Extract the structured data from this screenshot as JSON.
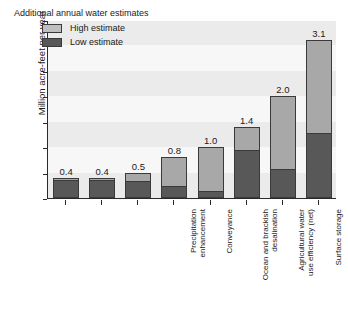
{
  "chart_data": {
    "type": "bar",
    "title": "",
    "xlabel": "",
    "ylabel": "Million acre-feet per year",
    "ylim": [
      0.0,
      3.5
    ],
    "yticks": [
      "0.0",
      "0.5",
      "1.0",
      "1.5",
      "2.0",
      "2.5",
      "3.0",
      "3.5"
    ],
    "grid": false,
    "legend_position": "top-left",
    "legend_title": "Additional annual water estimates",
    "categories": [
      "Precipitation\nenhancement",
      "Conveyance",
      "Ocean and brackish\ndesalination",
      "Agricultural water\nuse efficiency (net)",
      "Surface storage",
      "Recycled municipal\nwater",
      "Conjunctive management\nand groundwater storage",
      "Urban water use\nefficiency (applied)"
    ],
    "series": [
      {
        "name": "Low estimate",
        "color": "#585858",
        "values": [
          0.34,
          0.33,
          0.31,
          0.21,
          0.12,
          0.93,
          0.55,
          1.25
        ]
      },
      {
        "name": "High estimate",
        "color": "#a8a8a8",
        "values": [
          0.4,
          0.4,
          0.5,
          0.8,
          1.0,
          1.4,
          2.0,
          3.1
        ]
      }
    ],
    "value_labels": [
      "0.4",
      "0.4",
      "0.5",
      "0.8",
      "1.0",
      "1.4",
      "2.0",
      "3.1"
    ]
  },
  "legend": {
    "title": "Additional annual water estimates",
    "items": [
      {
        "label": "High estimate",
        "color": "#a8a8a8"
      },
      {
        "label": "Low estimate",
        "color": "#585858"
      }
    ]
  },
  "axis": {
    "y_title": "Million acre-feet per year"
  }
}
